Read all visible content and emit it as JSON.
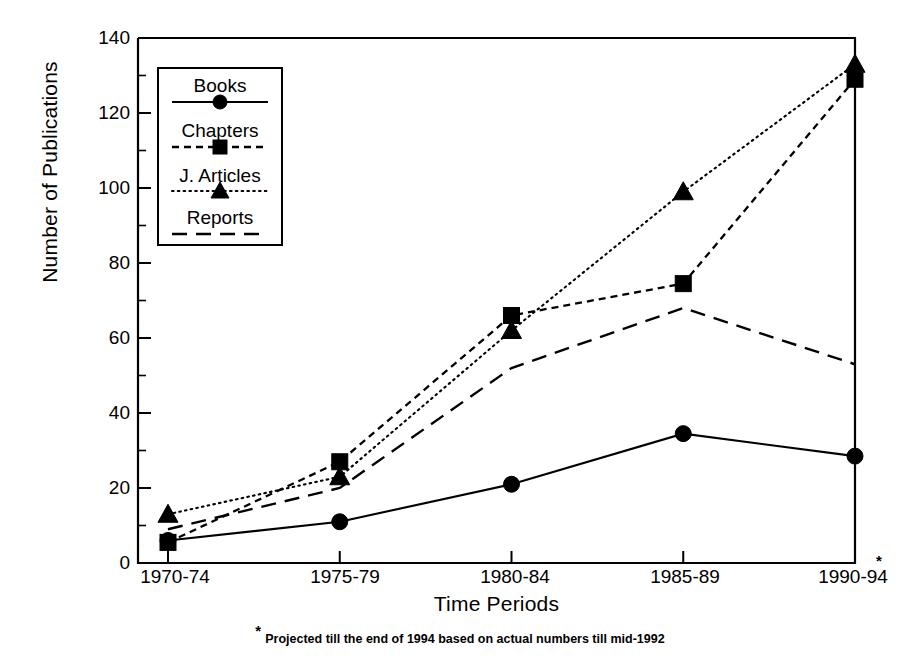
{
  "chart_data": {
    "type": "line",
    "title": "",
    "xlabel": "Time Periods",
    "ylabel": "Number of Publications",
    "categories": [
      "1970-74",
      "1975-79",
      "1980-84",
      "1985-89",
      "1990-94"
    ],
    "ylim": [
      0,
      140
    ],
    "ytick_values": [
      0,
      20,
      40,
      60,
      80,
      100,
      120,
      140
    ],
    "ytick_labels": [
      "0",
      "20",
      "40",
      "60",
      "80",
      "100",
      "120",
      "140"
    ],
    "yminor_values": [
      10,
      30,
      50,
      70,
      90,
      110,
      130
    ],
    "grid": false,
    "legend_position": "upper left inside",
    "series": [
      {
        "name": "Books",
        "marker": "circle",
        "line_style": "solid",
        "values": [
          6,
          11,
          21,
          34.5,
          28.5
        ]
      },
      {
        "name": "Chapters",
        "marker": "square",
        "line_style": "dashed",
        "values": [
          5.5,
          27,
          66,
          74.5,
          129
        ]
      },
      {
        "name": "J. Articles",
        "marker": "triangle",
        "line_style": "dotted",
        "values": [
          13,
          23,
          62,
          99,
          133
        ]
      },
      {
        "name": "Reports",
        "marker": "none",
        "line_style": "long-dash",
        "values": [
          9,
          20,
          52,
          68,
          53
        ]
      }
    ],
    "annotations": [
      {
        "name": "projection-asterisk",
        "text": "*",
        "near": "1990-94"
      }
    ],
    "footnote": {
      "star": "*",
      "text": "Projected till the end of 1994 based on actual numbers till mid-1992"
    }
  },
  "legend": {
    "entries": [
      {
        "label": "Books",
        "icon": "solid-line-circle-marker"
      },
      {
        "label": "Chapters",
        "icon": "dashed-line-square-marker"
      },
      {
        "label": "J. Articles",
        "icon": "dotted-line-triangle-marker"
      },
      {
        "label": "Reports",
        "icon": "long-dashed-line"
      }
    ]
  },
  "colors": {
    "ink": "#000000",
    "background": "#ffffff"
  }
}
